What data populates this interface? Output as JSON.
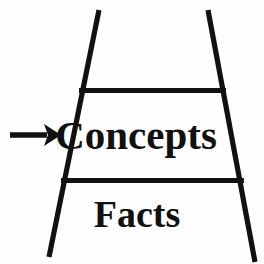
{
  "figure": {
    "type": "ladder-of-abstraction-diagram",
    "background_color": "#fefefe",
    "ink_color": "#111111",
    "bands": [
      {
        "id": "top",
        "label": "",
        "label_visible": false
      },
      {
        "id": "middle",
        "label": "Concepts",
        "label_visible": true
      },
      {
        "id": "bottom",
        "label": "Facts",
        "label_visible": true
      }
    ],
    "annotation": {
      "marker": "arrow-right",
      "points_to": "Concepts",
      "label": ""
    },
    "shape": {
      "name": "trapezoid-ladder",
      "left_leg": {
        "top_x": 99,
        "top_y": 10,
        "bottom_x": 49,
        "bottom_y": 257
      },
      "right_leg": {
        "top_x": 208,
        "top_y": 10,
        "bottom_x": 255,
        "bottom_y": 262
      },
      "rungs": [
        {
          "y": 90,
          "x_start": 80,
          "x_end": 225
        },
        {
          "y": 180,
          "x_start": 62,
          "x_end": 243
        }
      ]
    },
    "arrow": {
      "shaft_start_x": 10,
      "shaft_end_x": 47,
      "tip_x": 60,
      "center_y": 135
    }
  },
  "labels": {
    "concepts": "Concepts",
    "facts": "Facts"
  }
}
